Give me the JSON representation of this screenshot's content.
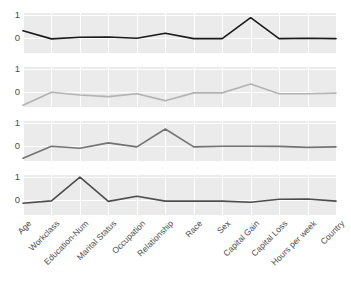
{
  "chart_data": {
    "type": "line",
    "title": "",
    "subtitle": "",
    "xlabel": "",
    "ylabel": "",
    "ylim": [
      -0.62,
      1.08
    ],
    "yticks": [
      0,
      1
    ],
    "ytick_labels": [
      "0",
      "1"
    ],
    "grid": true,
    "legend_position": "none",
    "facet_layout": "4 stacked panels sharing x-axis",
    "categories": [
      "Age",
      "Workclass",
      "Education-Num",
      "Marital Status",
      "Occupation",
      "Relationship",
      "Race",
      "Sex",
      "Capital Gain",
      "Capital Loss",
      "Hours per week",
      "Country"
    ],
    "series": [
      {
        "name": "panel-1",
        "color": "#1a1a1a",
        "values": [
          0.33,
          -0.02,
          0.05,
          0.06,
          0.01,
          0.22,
          -0.01,
          -0.01,
          0.88,
          -0.01,
          0.01,
          -0.01
        ]
      },
      {
        "name": "panel-2",
        "color": "#b3b3b3",
        "values": [
          -0.55,
          0.01,
          -0.11,
          -0.18,
          -0.06,
          -0.35,
          -0.02,
          -0.02,
          0.36,
          -0.06,
          -0.06,
          -0.03
        ]
      },
      {
        "name": "panel-3",
        "color": "#737373",
        "values": [
          -0.5,
          0.01,
          -0.08,
          0.15,
          -0.02,
          0.74,
          -0.02,
          0.01,
          0.01,
          0.0,
          -0.04,
          -0.02
        ]
      },
      {
        "name": "panel-4",
        "color": "#4d4d4d",
        "values": [
          -0.12,
          -0.02,
          0.99,
          -0.04,
          0.18,
          -0.03,
          -0.03,
          -0.03,
          -0.08,
          0.05,
          0.06,
          -0.03
        ]
      }
    ]
  },
  "panels": [
    {
      "id": "panel-1",
      "yticks": [
        "1",
        "0"
      ]
    },
    {
      "id": "panel-2",
      "yticks": [
        "1",
        "0"
      ]
    },
    {
      "id": "panel-3",
      "yticks": [
        "1",
        "0"
      ]
    },
    {
      "id": "panel-4",
      "yticks": [
        "1",
        "0"
      ]
    }
  ]
}
